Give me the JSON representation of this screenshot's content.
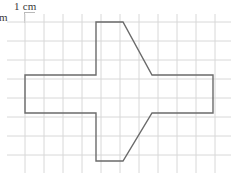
{
  "figure": {
    "title_label": "1 cm",
    "side_label": "cm",
    "grid": {
      "cell_size_px": 19,
      "cell_label": "1 cm",
      "columns": 12,
      "rows": 9,
      "origin_x": 25,
      "origin_y": 22,
      "line_color": "#d8d8d8",
      "background": "#ffffff"
    }
  },
  "chart_data": {
    "type": "table",
    "xlabel": "",
    "ylabel": "",
    "grid": true,
    "legend": "none",
    "unit": "cm",
    "grid_cell_cm": 1,
    "shape": {
      "name": "cross-polygon",
      "stroke_color": "#6b6b6b",
      "fill": "none",
      "stroke_width_px": 1.4,
      "vertices_px": [
        [
          96,
          22
        ],
        [
          123,
          22
        ],
        [
          152,
          75
        ],
        [
          213,
          75
        ],
        [
          213,
          113
        ],
        [
          152,
          113
        ],
        [
          123,
          161
        ],
        [
          96,
          161
        ],
        [
          96,
          113
        ],
        [
          25,
          113
        ],
        [
          25,
          75
        ],
        [
          96,
          75
        ]
      ],
      "vertices_cm": [
        [
          3.74,
          0
        ],
        [
          5.16,
          0
        ],
        [
          6.68,
          2.79
        ],
        [
          9.89,
          2.79
        ],
        [
          9.89,
          4.79
        ],
        [
          6.68,
          4.79
        ],
        [
          5.16,
          7.32
        ],
        [
          3.74,
          7.32
        ],
        [
          3.74,
          4.79
        ],
        [
          0,
          4.79
        ],
        [
          0,
          2.79
        ],
        [
          3.74,
          2.79
        ]
      ]
    }
  }
}
